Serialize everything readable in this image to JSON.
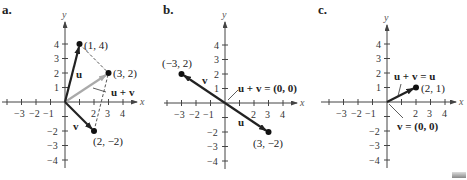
{
  "panels": [
    {
      "label": "a.",
      "axis_x": "x",
      "axis_y": "y",
      "x_ticks": [
        "−3",
        "−2",
        "−1",
        "2",
        "3",
        "4"
      ],
      "y_ticks": [
        "4",
        "3",
        "2",
        "1",
        "−2",
        "−3",
        "−4"
      ],
      "points": [
        {
          "label": "(1, 4)",
          "x": 1,
          "y": 4
        },
        {
          "label": "(3, 2)",
          "x": 3,
          "y": 2
        },
        {
          "label": "(2, −2)",
          "x": 2,
          "y": -2
        }
      ],
      "vectors": [
        {
          "name": "u",
          "from": [
            0,
            0
          ],
          "to": [
            1,
            4
          ],
          "color": "#222222"
        },
        {
          "name": "v",
          "from": [
            0,
            0
          ],
          "to": [
            2,
            -2
          ],
          "color": "#222222"
        },
        {
          "name": "u + v",
          "from": [
            0,
            0
          ],
          "to": [
            3,
            2
          ],
          "color": "#aaaaaa"
        }
      ],
      "vector_labels": {
        "u": "u",
        "v": "v",
        "sum": "u + v"
      }
    },
    {
      "label": "b.",
      "axis_x": "x",
      "axis_y": "y",
      "x_ticks": [
        "−3",
        "−2",
        "−1",
        "2",
        "3",
        "4"
      ],
      "y_ticks": [
        "4",
        "3",
        "2",
        "1",
        "−2",
        "−3",
        "−4"
      ],
      "points": [
        {
          "label": "(−3, 2)",
          "x": -3,
          "y": 2
        },
        {
          "label": "(3, −2)",
          "x": 3,
          "y": -2
        }
      ],
      "vectors": [
        {
          "name": "v",
          "from": [
            0,
            0
          ],
          "to": [
            -3,
            2
          ],
          "color": "#222222"
        },
        {
          "name": "u",
          "from": [
            0,
            0
          ],
          "to": [
            3,
            -2
          ],
          "color": "#222222"
        }
      ],
      "vector_labels": {
        "u": "u",
        "v": "v",
        "sum": "u + v = (0, 0)"
      }
    },
    {
      "label": "c.",
      "axis_x": "x",
      "axis_y": "y",
      "x_ticks": [
        "−3",
        "−2",
        "−1",
        "2",
        "3",
        "4"
      ],
      "y_ticks": [
        "4",
        "3",
        "2",
        "1",
        "−2",
        "−3",
        "−4"
      ],
      "points": [
        {
          "label": "(2, 1)",
          "x": 2,
          "y": 1
        }
      ],
      "vectors": [
        {
          "name": "u",
          "from": [
            0,
            0
          ],
          "to": [
            2,
            1
          ],
          "color": "#222222"
        }
      ],
      "vector_labels": {
        "sum": "u + v = u",
        "v": "v = (0, 0)"
      }
    }
  ]
}
